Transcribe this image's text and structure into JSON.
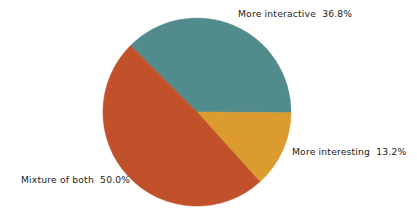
{
  "chart_data": {
    "type": "pie",
    "title": "",
    "subtitle": "",
    "xlabel": "",
    "ylabel": "",
    "legend_position": "none",
    "grid": false,
    "labels_outside": true,
    "units": "percent",
    "categories": [
      "More interactive",
      "Mixture of both",
      "More interesting"
    ],
    "values": [
      36.8,
      50.0,
      13.2
    ],
    "value_labels": [
      "36.8%",
      "50.0%",
      "13.2%"
    ],
    "colors": [
      "#528b8b",
      "#c0512b",
      "#db9b2e"
    ],
    "slices": [
      {
        "label": "More interactive",
        "value": 36.8,
        "value_label": "36.8%",
        "display_text": "More interactive  36.8%",
        "color": "#528b8b",
        "start_angle_deg": 225.0,
        "end_angle_deg": 360.4
      },
      {
        "label": "More interesting",
        "value": 13.2,
        "value_label": "13.2%",
        "display_text": "More interesting  13.2%",
        "color": "#db9b2e",
        "start_angle_deg": 0.4,
        "end_angle_deg": 48.0
      },
      {
        "label": "Mixture of both",
        "value": 50.0,
        "value_label": "50.0%",
        "display_text": "Mixture of both  50.0%",
        "color": "#c0512b",
        "start_angle_deg": 48.0,
        "end_angle_deg": 225.0
      }
    ],
    "geometry": {
      "center_x": 197,
      "center_y": 112,
      "radius": 94
    },
    "background_color": "#ffffff",
    "text_color": "#1c1c1c"
  }
}
